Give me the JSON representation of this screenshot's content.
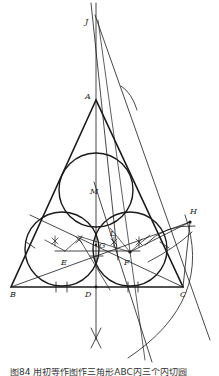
{
  "figure": {
    "caption": "图84 用初等作图作三角形ABC内三个内切圆",
    "labels": {
      "J": "J",
      "A": "A",
      "M": "M",
      "H": "H",
      "L": "L",
      "G": "G",
      "E": "E",
      "F": "F",
      "B": "B",
      "D": "D",
      "C": "C"
    },
    "colors": {
      "stroke": "#1a1a1a",
      "background": "#ffffff"
    }
  }
}
